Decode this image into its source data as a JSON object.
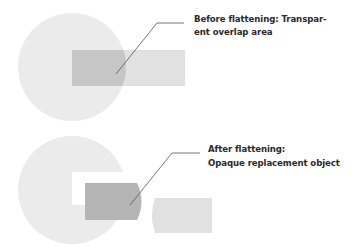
{
  "diagram": {
    "before": {
      "label_line1": "Before flattening: Transpar-",
      "label_line2": "ent overlap area"
    },
    "after": {
      "label_line1": "After flattening:",
      "label_line2": "Opaque replacement object"
    },
    "colors": {
      "circle": "#ebebeb",
      "rectangle": "#e1e1e1",
      "overlap": "#c6c6c6",
      "replacement": "#b5b5b5",
      "leader": "#555555",
      "text": "#2a2a2a"
    }
  }
}
